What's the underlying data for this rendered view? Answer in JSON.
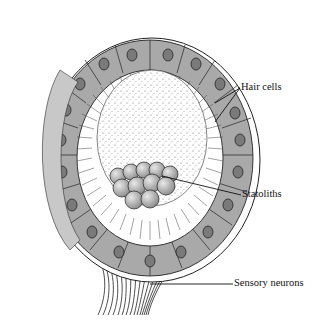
{
  "figure": {
    "labels": {
      "hair_cells": "Hair cells",
      "statoliths": "Statoliths",
      "sensory_neurons": "Sensory neurons"
    },
    "colors": {
      "cell_fill": "#a9a9a9",
      "nucleus_fill": "#7a7a7a",
      "outline": "#222222",
      "background": "#ffffff"
    }
  }
}
